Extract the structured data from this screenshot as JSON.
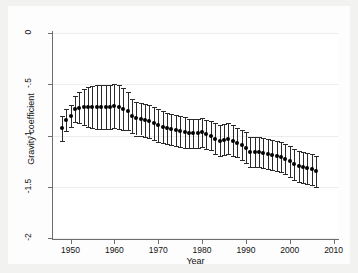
{
  "chart_data": {
    "type": "scatter",
    "title": "",
    "subtitle": "",
    "xlabel": "Year",
    "ylabel": "Gravity coefficient",
    "xlim": [
      1946,
      2011
    ],
    "ylim": [
      -2,
      0
    ],
    "xticks": [
      1950,
      1960,
      1970,
      1980,
      1990,
      2000,
      2010
    ],
    "xtick_labels": [
      "1950",
      "1960",
      "1970",
      "1980",
      "1990",
      "2000",
      "2010"
    ],
    "yticks": [
      0,
      -0.5,
      -1,
      -1.5,
      -2
    ],
    "ytick_labels": [
      "0",
      "-.5",
      "-1",
      "-1.5",
      "-2"
    ],
    "grid": "horizontal",
    "legend": "none",
    "error_bar_style": "capped vertical 95% confidence interval",
    "marker_style": "filled circle",
    "series": [
      {
        "name": "Gravity coefficient",
        "x": [
          1948,
          1949,
          1950,
          1951,
          1952,
          1953,
          1954,
          1955,
          1956,
          1957,
          1958,
          1959,
          1960,
          1961,
          1962,
          1963,
          1964,
          1965,
          1966,
          1967,
          1968,
          1969,
          1970,
          1971,
          1972,
          1973,
          1974,
          1975,
          1976,
          1977,
          1978,
          1979,
          1980,
          1981,
          1982,
          1983,
          1984,
          1985,
          1986,
          1987,
          1988,
          1989,
          1990,
          1991,
          1992,
          1993,
          1994,
          1995,
          1996,
          1997,
          1998,
          1999,
          2000,
          2001,
          2002,
          2003,
          2004,
          2005,
          2006
        ],
        "values": [
          -0.93,
          -0.85,
          -0.81,
          -0.74,
          -0.73,
          -0.72,
          -0.72,
          -0.72,
          -0.72,
          -0.72,
          -0.72,
          -0.72,
          -0.71,
          -0.72,
          -0.74,
          -0.76,
          -0.81,
          -0.83,
          -0.84,
          -0.85,
          -0.86,
          -0.88,
          -0.9,
          -0.92,
          -0.93,
          -0.94,
          -0.95,
          -0.96,
          -0.97,
          -0.98,
          -0.98,
          -0.98,
          -0.97,
          -0.99,
          -1.0,
          -1.03,
          -1.05,
          -1.04,
          -1.03,
          -1.05,
          -1.07,
          -1.09,
          -1.12,
          -1.16,
          -1.16,
          -1.16,
          -1.17,
          -1.18,
          -1.19,
          -1.2,
          -1.21,
          -1.23,
          -1.25,
          -1.28,
          -1.3,
          -1.31,
          -1.32,
          -1.33,
          -1.35
        ],
        "ci_low": [
          -1.05,
          -0.96,
          -0.92,
          -0.87,
          -0.88,
          -0.9,
          -0.92,
          -0.93,
          -0.94,
          -0.94,
          -0.94,
          -0.94,
          -0.93,
          -0.94,
          -0.95,
          -0.95,
          -0.98,
          -1.0,
          -1.0,
          -1.01,
          -1.02,
          -1.04,
          -1.06,
          -1.07,
          -1.08,
          -1.09,
          -1.1,
          -1.11,
          -1.12,
          -1.12,
          -1.12,
          -1.12,
          -1.11,
          -1.13,
          -1.14,
          -1.18,
          -1.2,
          -1.19,
          -1.18,
          -1.2,
          -1.21,
          -1.24,
          -1.27,
          -1.31,
          -1.31,
          -1.31,
          -1.32,
          -1.33,
          -1.34,
          -1.35,
          -1.36,
          -1.38,
          -1.4,
          -1.43,
          -1.45,
          -1.46,
          -1.47,
          -1.48,
          -1.5
        ],
        "ci_high": [
          -0.81,
          -0.74,
          -0.7,
          -0.61,
          -0.58,
          -0.55,
          -0.53,
          -0.52,
          -0.51,
          -0.51,
          -0.51,
          -0.51,
          -0.5,
          -0.51,
          -0.54,
          -0.58,
          -0.64,
          -0.67,
          -0.68,
          -0.69,
          -0.7,
          -0.72,
          -0.74,
          -0.76,
          -0.78,
          -0.79,
          -0.8,
          -0.81,
          -0.82,
          -0.84,
          -0.84,
          -0.84,
          -0.83,
          -0.85,
          -0.86,
          -0.88,
          -0.9,
          -0.89,
          -0.88,
          -0.9,
          -0.93,
          -0.95,
          -0.97,
          -1.01,
          -1.01,
          -1.01,
          -1.02,
          -1.03,
          -1.04,
          -1.05,
          -1.06,
          -1.08,
          -1.1,
          -1.13,
          -1.15,
          -1.16,
          -1.17,
          -1.18,
          -1.2
        ]
      }
    ]
  }
}
